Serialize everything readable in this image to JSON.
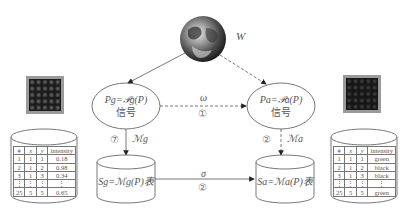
{
  "world": {
    "label": "W",
    "icon": "earth-globe-icon"
  },
  "nodes": {
    "left_signal": {
      "formula": "P_g = 𝒫_g(P)",
      "formula_display": "Pg=𝒫g(P)",
      "caption": "信号"
    },
    "right_signal": {
      "formula": "P_a = 𝒫_a(P)",
      "formula_display": "Pa=𝒫a(P)",
      "caption": "信号"
    },
    "left_store": {
      "formula": "S_g = ℳ_g(P)表",
      "formula_display": "Sg=ℳg(P)表"
    },
    "right_store": {
      "formula": "S_a = ℳ_a(P)表",
      "formula_display": "Sa=ℳa(P)表"
    }
  },
  "edges": {
    "signal_link": {
      "label": "ω",
      "step": "①"
    },
    "store_link": {
      "label": "σ",
      "step": "②"
    },
    "left_map": {
      "label": "ℳg",
      "step": "⑦"
    },
    "right_map": {
      "label": "ℳa",
      "step": "②"
    }
  },
  "left_table": {
    "headers": [
      "#",
      "x",
      "y",
      "intensity"
    ],
    "rows": [
      [
        "1",
        "1",
        "1",
        "0.18"
      ],
      [
        "2",
        "1",
        "2",
        "0.98"
      ],
      [
        "3",
        "1",
        "3",
        "0.34"
      ],
      [
        "⋮",
        "⋮",
        "⋮",
        "⋮"
      ],
      [
        "25",
        "5",
        "5",
        "0.65"
      ]
    ]
  },
  "right_table": {
    "headers": [
      "#",
      "x",
      "y",
      "intensity"
    ],
    "rows": [
      [
        "1",
        "1",
        "1",
        "green"
      ],
      [
        "2",
        "1",
        "2",
        "black"
      ],
      [
        "3",
        "1",
        "3",
        "black"
      ],
      [
        "⋮",
        "⋮",
        "⋮",
        "⋮"
      ],
      [
        "25",
        "5",
        "5",
        "green"
      ]
    ]
  },
  "images": {
    "left": "grayscale-grid-image",
    "right": "color-grid-image"
  },
  "colors": {
    "line": "#555555",
    "text": "#555555",
    "thumb_border": "#9a9a9a"
  }
}
